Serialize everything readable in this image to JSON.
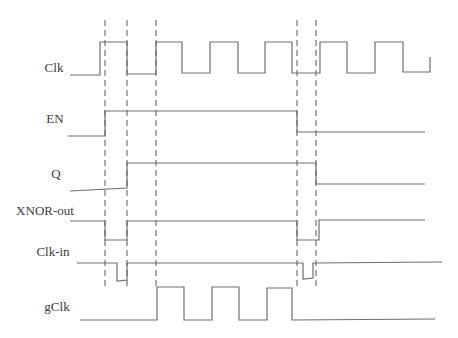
{
  "diagram": {
    "title": "",
    "signals": [
      {
        "name": "Clk",
        "label_x": 54,
        "label_y": 68
      },
      {
        "name": "EN",
        "label_x": 55,
        "label_y": 119
      },
      {
        "name": "Q",
        "label_x": 56,
        "label_y": 174
      },
      {
        "name": "XNOR-out",
        "label_x": 45,
        "label_y": 211
      },
      {
        "name": "Clk-in",
        "label_x": 53,
        "label_y": 252
      },
      {
        "name": "gClk",
        "label_x": 57,
        "label_y": 307
      }
    ],
    "waveforms": {
      "Clk": "M70,75 L100,75 L100,42 L127,42 L127,74 L156,74 L156,42 L182,42 L182,73 L210,73 L210,42 L238,42 L238,73 L265,73 L265,42 L292,42 L292,73 L320,73 L320,42 L347,42 L347,73 L375,73 L375,42 L403,42 L403,72 L430,72 L430,57",
      "EN": "M68,136 L105,136 L105,111 L297,111 L297,132 L425,132",
      "Q": "M70,191 L127,188 L127,163 L316,163 L316,184 L425,184",
      "XNOR-out": "M70,221 L105,221 L105,240 L127,240 L127,221 L297,221 L297,240 L319,240 L319,220 L425,220",
      "Clk-in": "M77,263 L117,263 L117,281 L127,280 L127,263 L303,263 L303,279 L313,278 L313,263 L442,262",
      "gClk": "M80,320 L157,320 L157,287 L184,287 L184,320 L212,320 L212,287 L239,287 L239,320 L267,320 L267,288 L292,288 L292,320 L435,319"
    },
    "dashed_markers_x": [
      105,
      127,
      156,
      297,
      316
    ],
    "dashed_y_range": [
      20,
      288
    ],
    "colors": {
      "wave": "#6e6e6e",
      "dash": "#555555",
      "label": "#3a3a3a",
      "background": "#ffffff"
    }
  }
}
